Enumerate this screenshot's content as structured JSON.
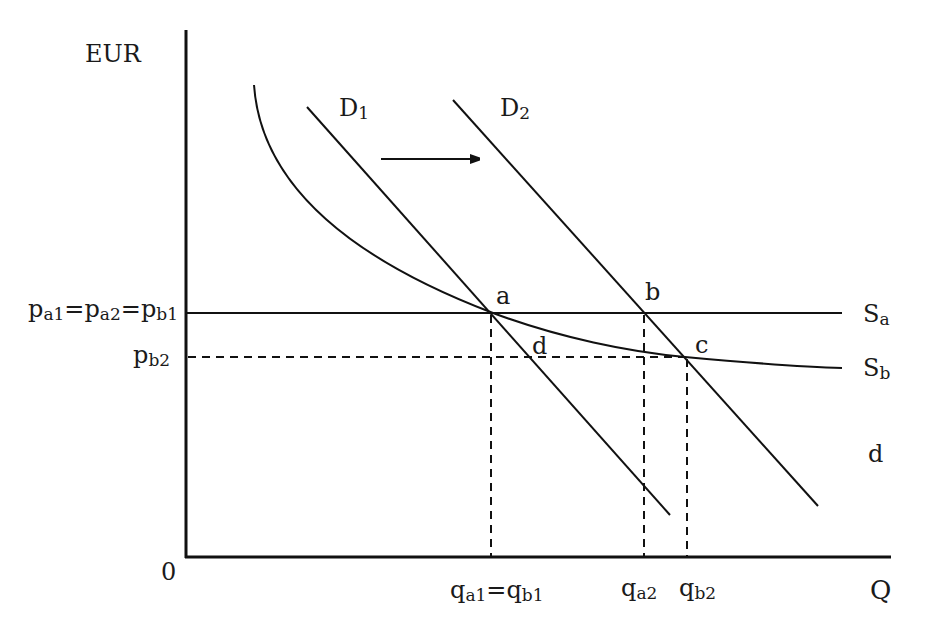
{
  "diagram": {
    "type": "supply-demand-economics",
    "y_axis_label": "EUR",
    "x_axis_label": "Q",
    "origin_label": "0",
    "curves": {
      "demand_1": {
        "base": "D",
        "sub": "1"
      },
      "demand_2": {
        "base": "D",
        "sub": "2"
      },
      "supply_a": {
        "base": "S",
        "sub": "a"
      },
      "supply_b": {
        "base": "S",
        "sub": "b"
      },
      "extra_label": "d"
    },
    "points": {
      "a": "a",
      "b": "b",
      "c": "c",
      "d": "d"
    },
    "price_labels": {
      "p_high": {
        "parts": [
          {
            "base": "p",
            "sub": "a1"
          },
          {
            "sep": "="
          },
          {
            "base": "p",
            "sub": "a2"
          },
          {
            "sep": "="
          },
          {
            "base": "p",
            "sub": "b1"
          }
        ]
      },
      "p_low": {
        "base": "p",
        "sub": "b2"
      }
    },
    "quantity_labels": {
      "q_a1_b1": {
        "parts": [
          {
            "base": "q",
            "sub": "a1"
          },
          {
            "sep": "="
          },
          {
            "base": "q",
            "sub": "b1"
          }
        ]
      },
      "q_a2": {
        "base": "q",
        "sub": "a2"
      },
      "q_b2": {
        "base": "q",
        "sub": "b2"
      }
    },
    "shift_arrow": "demand shifts right from D1 to D2"
  }
}
